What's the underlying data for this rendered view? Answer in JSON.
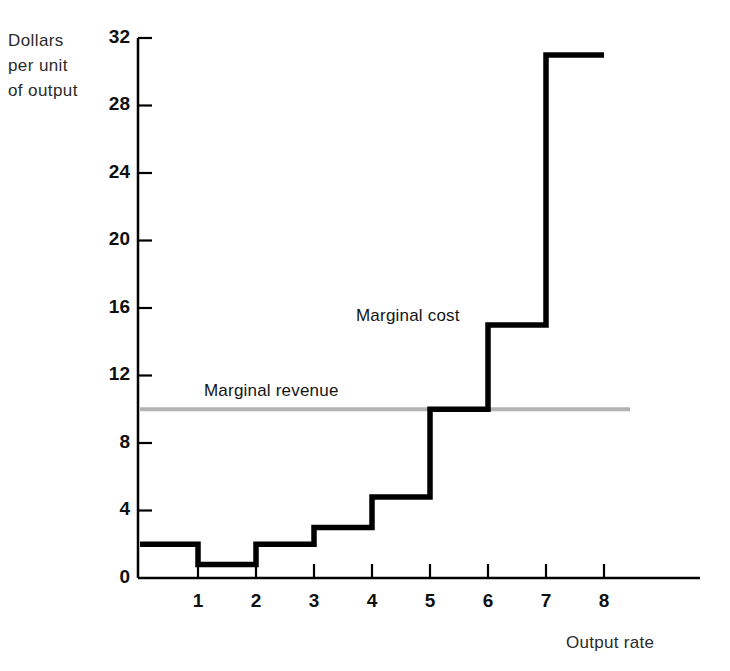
{
  "chart_data": {
    "type": "line",
    "title": "",
    "xlabel": "Output rate",
    "ylabel": "Dollars per unit of output",
    "ylabel_lines": [
      "Dollars",
      "per unit",
      "of output"
    ],
    "xlim": [
      0,
      9
    ],
    "ylim": [
      0,
      32
    ],
    "grid": false,
    "legend_position": "inline-annotations",
    "x_ticks": [
      1,
      2,
      3,
      4,
      5,
      6,
      7,
      8
    ],
    "x_tick_labels": [
      "1",
      "2",
      "3",
      "4",
      "5",
      "6",
      "7",
      "8"
    ],
    "y_ticks": [
      0,
      4,
      8,
      12,
      16,
      20,
      24,
      28,
      32
    ],
    "y_tick_labels": [
      "0",
      "4",
      "8",
      "12",
      "16",
      "20",
      "24",
      "28",
      "32"
    ],
    "series": [
      {
        "name": "Marginal cost",
        "style": "step",
        "color": "#000000",
        "line_width": 5,
        "categories": [
          "0-1",
          "1-2",
          "2-3",
          "3-4",
          "4-5",
          "5-6",
          "6-7",
          "7-8"
        ],
        "values": [
          2,
          0.8,
          2,
          3,
          4.8,
          10,
          15,
          31
        ]
      },
      {
        "name": "Marginal revenue",
        "style": "horizontal-line",
        "color": "#b3b3b3",
        "line_width": 4,
        "value": 10,
        "x_start": 0,
        "x_end": 8.45
      }
    ],
    "annotations": [
      {
        "text": "Marginal cost",
        "x": 4.2,
        "y": 16.5
      },
      {
        "text": "Marginal revenue",
        "x": 1.5,
        "y": 11.8
      }
    ]
  },
  "axis": {
    "y_title": "Dollars\nper unit\nof output",
    "x_title": "Output rate"
  },
  "colors": {
    "marginal_cost": "#000000",
    "marginal_revenue": "#b3b3b3",
    "axis": "#000000",
    "background": "#ffffff"
  }
}
